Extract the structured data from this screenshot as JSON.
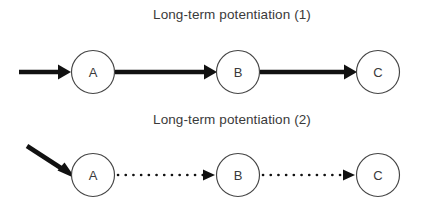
{
  "figure": {
    "background_color": "#ffffff",
    "line_color": "#111111",
    "text_color": "#3a3a3a",
    "circle_stroke_color": "#444444",
    "width": 427,
    "height": 210
  },
  "panels": [
    {
      "id": "panel-1",
      "title": "Long-term potentiation (1)",
      "title_x": 232,
      "title_y": 19,
      "nodes": [
        {
          "label": "A",
          "cx": 93,
          "cy": 72,
          "r": 21.5
        },
        {
          "label": "B",
          "cx": 238,
          "cy": 72,
          "r": 21.5
        },
        {
          "label": "C",
          "cx": 378,
          "cy": 72,
          "r": 21.5
        }
      ],
      "edges": [
        {
          "id": "input-arrow-1",
          "style": "thick",
          "from": "external",
          "to": "A",
          "x1": 19,
          "y1": 72,
          "x2": 70,
          "y2": 72
        },
        {
          "id": "edge-a-b-1",
          "style": "thick",
          "from": "A",
          "to": "B",
          "x1": 115,
          "y1": 72,
          "x2": 216,
          "y2": 72
        },
        {
          "id": "edge-b-c-1",
          "style": "thick",
          "from": "B",
          "to": "C",
          "x1": 260,
          "y1": 72,
          "x2": 356,
          "y2": 72
        }
      ]
    },
    {
      "id": "panel-2",
      "title": "Long-term potentiation (2)",
      "title_x": 232,
      "title_y": 124,
      "nodes": [
        {
          "label": "A",
          "cx": 93,
          "cy": 175,
          "r": 21.5
        },
        {
          "label": "B",
          "cx": 238,
          "cy": 175,
          "r": 21.5
        },
        {
          "label": "C",
          "cx": 378,
          "cy": 175,
          "r": 21.5
        }
      ],
      "edges": [
        {
          "id": "input-arrow-2",
          "style": "thick-diagonal",
          "from": "external",
          "to": "A",
          "x1": 27,
          "y1": 146,
          "x2": 75,
          "y2": 177
        },
        {
          "id": "edge-a-b-2",
          "style": "dotted",
          "from": "A",
          "to": "B",
          "x1": 116,
          "y1": 175,
          "x2": 214,
          "y2": 175
        },
        {
          "id": "edge-b-c-2",
          "style": "dotted",
          "from": "B",
          "to": "C",
          "x1": 261,
          "y1": 175,
          "x2": 354,
          "y2": 175
        }
      ]
    }
  ]
}
